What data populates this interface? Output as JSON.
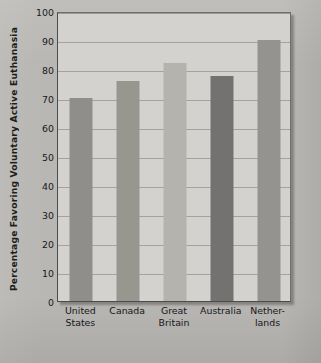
{
  "chart_data": {
    "type": "bar",
    "title": "",
    "xlabel": "",
    "ylabel": "Percentage Favoring Voluntary Active Euthanasia",
    "categories": [
      "United States",
      "Canada",
      "Great Britain",
      "Australia",
      "Netherlands"
    ],
    "category_lines": [
      [
        "United",
        "States"
      ],
      [
        "Canada",
        ""
      ],
      [
        "Great",
        "Britain"
      ],
      [
        "Australia",
        ""
      ],
      [
        "Nether-",
        "lands"
      ]
    ],
    "values": [
      70,
      76,
      82,
      77.5,
      90
    ],
    "ylim": [
      0,
      100
    ],
    "yticks": [
      0,
      10,
      20,
      30,
      40,
      50,
      60,
      70,
      80,
      90,
      100
    ],
    "ytick_labels": [
      "0",
      "10",
      "20",
      "30",
      "40",
      "50",
      "60",
      "70",
      "80",
      "90",
      "100"
    ],
    "grid": "horizontal",
    "legend": "none",
    "bar_colors": [
      "#8f8e8a",
      "#98978f",
      "#b4b3ad",
      "#737270",
      "#949390"
    ],
    "plot_background": "#d3d2ce",
    "page_background": "#b8b7b3",
    "axis_color": "#4c4c4c",
    "gridline_color": "#a3a29e"
  }
}
